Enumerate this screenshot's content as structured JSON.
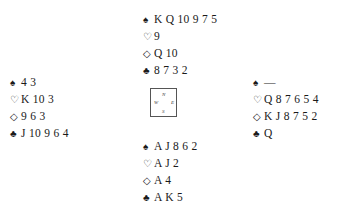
{
  "suit_symbols": {
    "spades": "♠",
    "hearts": "♡",
    "diamonds": "◇",
    "clubs": "♣"
  },
  "hands": {
    "north": {
      "spades": "K Q 10 9 7 5",
      "hearts": "9",
      "diamonds": "Q 10",
      "clubs": "8 7 3 2"
    },
    "west": {
      "spades": "4 3",
      "hearts": "K 10 3",
      "diamonds": "9 6 3",
      "clubs": "J 10 9 6 4"
    },
    "east": {
      "spades": "—",
      "hearts": "Q 8 7 6 5 4",
      "diamonds": "K J 8 7 5 2",
      "clubs": "Q"
    },
    "south": {
      "spades": "A J 8 6 2",
      "hearts": "A J 2",
      "diamonds": "A 4",
      "clubs": "A K 5"
    }
  },
  "compass": {
    "n": "N",
    "s": "S",
    "w": "W",
    "e": "E"
  }
}
